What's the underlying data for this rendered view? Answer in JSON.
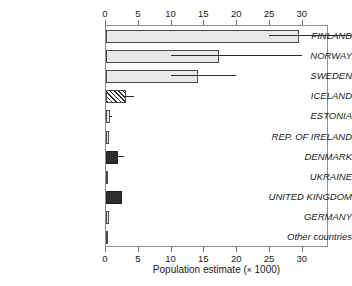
{
  "chart_data": {
    "type": "bar",
    "orientation": "horizontal",
    "title": "",
    "xlabel": "Population estimate (× 1000)",
    "ylabel": "",
    "xlim": [
      0,
      34
    ],
    "xticks": [
      0,
      5,
      10,
      15,
      20,
      25,
      30
    ],
    "xticklabels": [
      "0",
      "5",
      "10",
      "15",
      "20",
      "25",
      "30"
    ],
    "grid": false,
    "legend": "none",
    "categories": [
      "FINLAND",
      "NORWAY",
      "SWEDEN",
      "ICELAND",
      "ESTONIA",
      "REP. OF IRELAND",
      "DENMARK",
      "UKRAINE",
      "UNITED KINGDOM",
      "GERMANY",
      "Other countries"
    ],
    "values": [
      29.5,
      17.3,
      14.0,
      3.0,
      0.6,
      0.5,
      1.9,
      0.3,
      2.4,
      0.4,
      0.3
    ],
    "errors_low": [
      25.0,
      10.0,
      10.0,
      3.0,
      0.6,
      null,
      1.9,
      null,
      null,
      null,
      null
    ],
    "errors_high": [
      37.5,
      30.0,
      20.0,
      4.4,
      1.1,
      null,
      2.9,
      null,
      null,
      null,
      null
    ],
    "fills": [
      "light",
      "light",
      "light",
      "hatch",
      "light",
      "light",
      "dark",
      "light",
      "dark",
      "light",
      "light"
    ],
    "colors": {
      "fill_light": "#e9e9e9",
      "fill_dark": "#2e2e2e",
      "bar_edge": "#4a4a4a",
      "axis": "#6f6f6f",
      "error_bar": "#2b2b2b",
      "text": "#1a1a1a",
      "background": "#ffffff"
    }
  },
  "axis": {
    "x_title_main": "Population estimate (",
    "x_title_times": "×",
    "x_title_unit": " 1000)"
  }
}
